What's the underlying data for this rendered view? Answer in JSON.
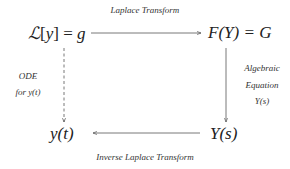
{
  "nodes": {
    "top_left": {
      "operator": "ℒ",
      "bracket_open": "[",
      "var": "y",
      "bracket_close": "]",
      "equals": "=",
      "rhs": "g"
    },
    "top_right": {
      "text": "F(Y) = G"
    },
    "bottom_left": {
      "text": "y(t)"
    },
    "bottom_right": {
      "text": "Y(s)"
    }
  },
  "edges": {
    "top": {
      "label": "Laplace Transform",
      "style": "solid",
      "direction": "right"
    },
    "right": {
      "label_lines": [
        "Algebraic",
        "Equation",
        "Y(s)"
      ],
      "style": "solid",
      "direction": "down"
    },
    "left": {
      "label_lines": [
        "ODE",
        "for y(t)"
      ],
      "style": "dashed",
      "direction": "down"
    },
    "bottom": {
      "label": "Inverse Laplace Transform",
      "style": "solid",
      "direction": "left"
    }
  },
  "colors": {
    "line": "#555555",
    "text": "#222222"
  }
}
